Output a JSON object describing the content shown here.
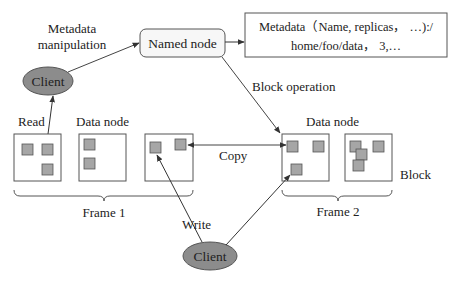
{
  "diagram": {
    "labels": {
      "metadata_manipulation_line1": "Metadata",
      "metadata_manipulation_line2": "manipulation",
      "named_node": "Named node",
      "metadata_line1": "Metadata（Name, replicas， …):/",
      "metadata_line2": "home/foo/data， 3,…",
      "client_top": "Client",
      "client_bottom": "Client",
      "block_operation": "Block operation",
      "read": "Read",
      "data_node_frame1": "Data node",
      "data_node_frame2": "Data node",
      "copy": "Copy",
      "block": "Block",
      "frame1": "Frame 1",
      "frame2": "Frame 2",
      "write": "Write"
    },
    "colors": {
      "client_fill": "#8c8c8c",
      "block_fill": "#a6a6a6",
      "named_node_fill": "#f7f7f7",
      "stroke": "#444444"
    }
  }
}
